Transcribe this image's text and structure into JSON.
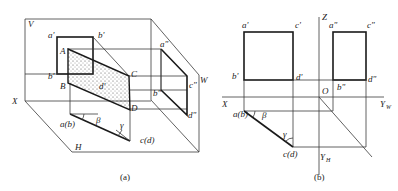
{
  "figure_a": {
    "caption": "(a)",
    "planes": {
      "V": "V",
      "W": "W",
      "H": "H"
    },
    "axis": {
      "X": "X"
    },
    "points": {
      "A": "A",
      "B": "B",
      "C": "C",
      "D": "D",
      "a_prime": "a'",
      "b_prime_top": "b'",
      "b_prime_left": "b'",
      "c_prime": "c'",
      "d_prime": "d'",
      "a_dprime": "a\"",
      "b_dprime": "b\"",
      "c_dprime": "c\"",
      "d_dprime": "d\"",
      "ab": "a(b)",
      "cd": "c(d)"
    },
    "angles": {
      "beta": "β",
      "gamma": "γ"
    }
  },
  "figure_b": {
    "caption": "(b)",
    "axes": {
      "X": "X",
      "Z": "Z",
      "O": "O",
      "YW": "Y",
      "YW_sub": "W",
      "YH": "Y",
      "YH_sub": "H"
    },
    "points": {
      "a_prime": "a'",
      "c_prime": "c'",
      "b_prime": "b'",
      "d_prime": "d'",
      "a_dprime": "a\"",
      "c_dprime": "c\"",
      "b_dprime": "b\"",
      "d_dprime": "d\"",
      "ab": "a(b)",
      "cd": "c(d)"
    },
    "angles": {
      "beta": "β",
      "gamma": "γ"
    }
  }
}
